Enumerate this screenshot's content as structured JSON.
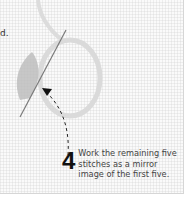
{
  "step": {
    "number": "4",
    "text": "Work the remaining five stitches as a mirror image of the first five.",
    "previous_fragment": "d."
  },
  "illustration": {
    "subject": "embroidery hoop of thread with needle and leaf-shaped fishbone stitch",
    "colors": {
      "thread": "#d9d9d9",
      "leaf": "#b8b8b8",
      "needle": "#7a7a7a",
      "arrow": "#222222"
    }
  }
}
